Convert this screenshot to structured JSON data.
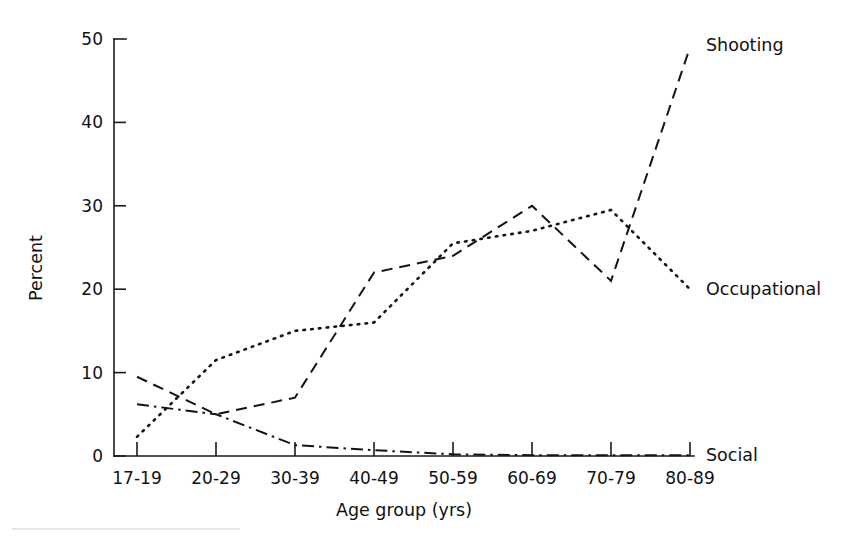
{
  "figure": {
    "background_color": "#ffffff",
    "ink_color": "#141414"
  },
  "chart_data": {
    "type": "line",
    "title": "",
    "subtitle": "",
    "xlabel": "Age group (yrs)",
    "ylabel": "Percent",
    "categories": [
      "17-19",
      "20-29",
      "30-39",
      "40-49",
      "50-59",
      "60-69",
      "70-79",
      "80-89"
    ],
    "ylim": [
      0,
      50
    ],
    "yticks": [
      0,
      10,
      20,
      30,
      40,
      50
    ],
    "yticklabels": [
      "0",
      "10",
      "20",
      "30",
      "40",
      "50"
    ],
    "grid": false,
    "legend_position": "right-inline-end-of-line",
    "series": [
      {
        "name": "Shooting",
        "linestyle": "dashed",
        "color": "#141414",
        "values": [
          9.5,
          5.0,
          7.0,
          22.0,
          24.0,
          30.0,
          21.0,
          49.0
        ],
        "label_y_value": 49.0
      },
      {
        "name": "Occupational",
        "linestyle": "dotted",
        "color": "#141414",
        "values": [
          2.3,
          11.5,
          15.0,
          16.0,
          25.5,
          27.0,
          29.5,
          20.0
        ],
        "label_y_value": 20.0
      },
      {
        "name": "Social",
        "linestyle": "dashdot",
        "color": "#141414",
        "values": [
          6.2,
          5.0,
          1.3,
          0.7,
          0.2,
          0.1,
          0.1,
          0.1
        ],
        "label_y_value": 0.1
      }
    ]
  },
  "axes": {
    "y_axis_title": "Percent",
    "x_axis_title": "Age group (yrs)"
  },
  "labels": {
    "shooting": "Shooting",
    "occupational": "Occupational",
    "social": "Social"
  }
}
